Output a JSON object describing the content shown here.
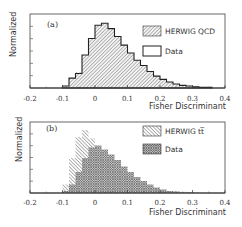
{
  "chart_data": [
    {
      "type": "bar",
      "panel_label": "(a)",
      "title": "",
      "xlabel": "Fisher Discriminant",
      "ylabel": "Normalized",
      "xlim": [
        -0.2,
        0.4
      ],
      "xticks": [
        "-0.2",
        "-0.1",
        "0",
        "0.1",
        "0.2",
        "0.3",
        "0.4"
      ],
      "bin_width": 0.02,
      "legend_position": "upper right",
      "grid": false,
      "series": [
        {
          "name": "HERWIG QCD",
          "style": "hatched-filled",
          "x": [
            -0.1,
            -0.08,
            -0.06,
            -0.04,
            -0.02,
            0.0,
            0.02,
            0.04,
            0.06,
            0.08,
            0.1,
            0.12,
            0.14,
            0.16,
            0.18,
            0.2,
            0.22,
            0.24,
            0.26,
            0.28,
            0.3,
            0.32,
            0.34
          ],
          "values": [
            0.03,
            0.15,
            0.24,
            0.5,
            0.75,
            0.95,
            0.98,
            0.9,
            0.78,
            0.65,
            0.53,
            0.42,
            0.34,
            0.25,
            0.18,
            0.13,
            0.09,
            0.06,
            0.04,
            0.03,
            0.02,
            0.01,
            0.01
          ]
        },
        {
          "name": "Data",
          "style": "outline",
          "x": [
            -0.1,
            -0.08,
            -0.06,
            -0.04,
            -0.02,
            0.0,
            0.02,
            0.04,
            0.06,
            0.08,
            0.1,
            0.12,
            0.14,
            0.16,
            0.18,
            0.2,
            0.22,
            0.24,
            0.26,
            0.28,
            0.3,
            0.32,
            0.34
          ],
          "values": [
            0.03,
            0.15,
            0.22,
            0.5,
            0.75,
            0.95,
            0.98,
            0.9,
            0.78,
            0.65,
            0.53,
            0.42,
            0.34,
            0.25,
            0.18,
            0.13,
            0.09,
            0.06,
            0.04,
            0.03,
            0.02,
            0.01,
            0.01
          ]
        }
      ]
    },
    {
      "type": "bar",
      "panel_label": "(b)",
      "title": "",
      "xlabel": "Fisher Discriminant",
      "ylabel": "Normalized",
      "xlim": [
        -0.2,
        0.4
      ],
      "xticks": [
        "-0.2",
        "-0.1",
        "0",
        "0.1",
        "0.2",
        "0.3",
        "0.4"
      ],
      "bin_width": 0.02,
      "legend_position": "upper right",
      "grid": false,
      "series": [
        {
          "name": "HERWIG tt̄",
          "style": "hatched-light",
          "x": [
            -0.1,
            -0.08,
            -0.06,
            -0.04,
            -0.02,
            0.0,
            0.02,
            0.04,
            0.06,
            0.08,
            0.1,
            0.12,
            0.14,
            0.16,
            0.18,
            0.2,
            0.22,
            0.24,
            0.26,
            0.28,
            0.3
          ],
          "values": [
            0.12,
            0.5,
            0.8,
            0.9,
            0.78,
            0.55,
            0.48,
            0.4,
            0.33,
            0.27,
            0.22,
            0.17,
            0.13,
            0.1,
            0.07,
            0.05,
            0.03,
            0.02,
            0.02,
            0.01,
            0.01
          ]
        },
        {
          "name": "Data",
          "style": "cross-hatched",
          "x": [
            -0.1,
            -0.08,
            -0.06,
            -0.04,
            -0.02,
            0.0,
            0.02,
            0.04,
            0.06,
            0.08,
            0.1,
            0.12,
            0.14,
            0.16,
            0.18,
            0.2,
            0.22,
            0.24,
            0.26,
            0.28
          ],
          "values": [
            0.03,
            0.12,
            0.3,
            0.5,
            0.65,
            0.68,
            0.62,
            0.55,
            0.47,
            0.38,
            0.3,
            0.23,
            0.17,
            0.12,
            0.08,
            0.05,
            0.03,
            0.02,
            0.01,
            0.01
          ]
        }
      ]
    }
  ],
  "panels": {
    "a": {
      "label": "(a)",
      "ylabel": "Normalized",
      "xlabel": "Fisher Discriminant",
      "legend": [
        "HERWIG QCD",
        "Data"
      ]
    },
    "b": {
      "label": "(b)",
      "ylabel": "Normalized",
      "xlabel": "Fisher Discriminant",
      "legend": [
        "HERWIG tt̅",
        "Data"
      ]
    }
  },
  "ticks": [
    "-0.2",
    "-0.1",
    "0",
    "0.1",
    "0.2",
    "0.3",
    "0.4"
  ]
}
